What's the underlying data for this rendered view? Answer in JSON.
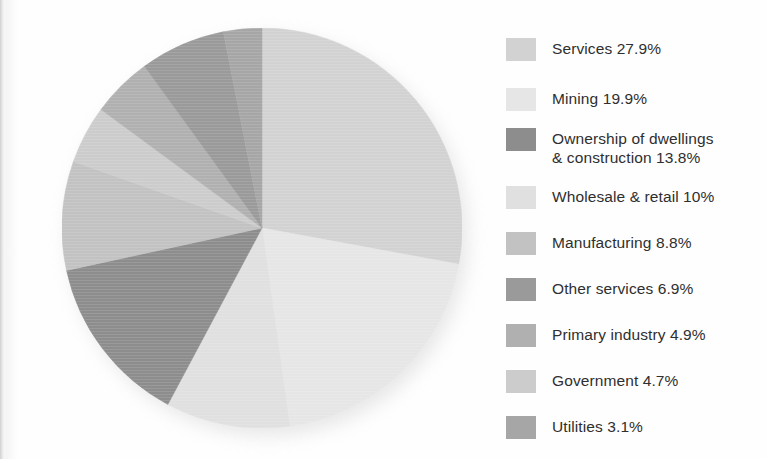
{
  "page": {
    "background_color": "#fefefe",
    "text_color": "#2f2f2f"
  },
  "chart_data": {
    "type": "pie",
    "title": "",
    "subtitle": "",
    "xlabel": "",
    "ylabel": "",
    "units": "percent",
    "total": 100.0,
    "start_angle_deg": 0,
    "direction": "clockwise",
    "legend_position": "right",
    "grid": false,
    "categories": [
      "Services",
      "Mining",
      "Ownership of dwellings & construction",
      "Wholesale & retail",
      "Manufacturing",
      "Other services",
      "Primary industry",
      "Government",
      "Utilities"
    ],
    "values": [
      27.9,
      19.9,
      13.8,
      10,
      8.8,
      6.9,
      4.9,
      4.7,
      3.1
    ],
    "value_labels": [
      "27.9%",
      "19.9%",
      "13.8%",
      "10%",
      "8.8%",
      "6.9%",
      "4.9%",
      "4.7%",
      "3.1%"
    ],
    "colors": [
      "#d2d2d2",
      "#e6e6e6",
      "#8d8d8d",
      "#e0e0e0",
      "#c2c2c2",
      "#9a9a9a",
      "#b0b0b0",
      "#cccccc",
      "#a6a6a6"
    ],
    "slice_order_clockwise_from_top": [
      "Services",
      "Mining",
      "Wholesale & retail",
      "Ownership of dwellings & construction",
      "Manufacturing",
      "Government",
      "Primary industry",
      "Other services",
      "Utilities"
    ],
    "geometry": {
      "center_x": 200,
      "center_y": 200,
      "radius": 200
    }
  },
  "legend": {
    "items": [
      {
        "label": "Services 27.9%",
        "name": "Services",
        "value_label": "27.9%",
        "value": 27.9,
        "color": "#d2d2d2",
        "top": 12,
        "lines": 1
      },
      {
        "label": "Mining 19.9%",
        "name": "Mining",
        "value_label": "19.9%",
        "value": 19.9,
        "color": "#e6e6e6",
        "top": 62,
        "lines": 1
      },
      {
        "label": "Ownership of dwellings\n& construction 13.8%",
        "name": "Ownership of dwellings & construction",
        "value_label": "13.8%",
        "value": 13.8,
        "color": "#8d8d8d",
        "top": 102,
        "lines": 2
      },
      {
        "label": "Wholesale & retail 10%",
        "name": "Wholesale & retail",
        "value_label": "10%",
        "value": 10,
        "color": "#e0e0e0",
        "top": 160,
        "lines": 1
      },
      {
        "label": "Manufacturing 8.8%",
        "name": "Manufacturing",
        "value_label": "8.8%",
        "value": 8.8,
        "color": "#c2c2c2",
        "top": 206,
        "lines": 1
      },
      {
        "label": "Other services 6.9%",
        "name": "Other services",
        "value_label": "6.9%",
        "value": 6.9,
        "color": "#9a9a9a",
        "top": 252,
        "lines": 1
      },
      {
        "label": "Primary industry 4.9%",
        "name": "Primary industry",
        "value_label": "4.9%",
        "value": 4.9,
        "color": "#b0b0b0",
        "top": 298,
        "lines": 1
      },
      {
        "label": "Government 4.7%",
        "name": "Government",
        "value_label": "4.7%",
        "value": 4.7,
        "color": "#cccccc",
        "top": 344,
        "lines": 1
      },
      {
        "label": "Utilities 3.1%",
        "name": "Utilities",
        "value_label": "3.1%",
        "value": 3.1,
        "color": "#a6a6a6",
        "top": 390,
        "lines": 1
      }
    ]
  }
}
